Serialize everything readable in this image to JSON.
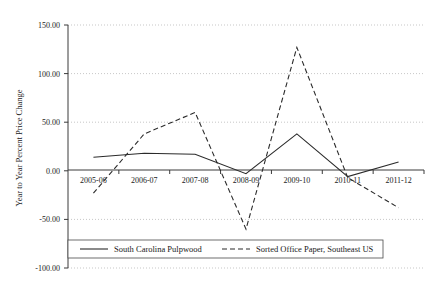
{
  "chart_data": {
    "type": "line",
    "title": "",
    "xlabel": "",
    "ylabel": "Year to Year Percent Price Change",
    "categories": [
      "2005-06",
      "2006-07",
      "2007-08",
      "2008-09",
      "2009-10",
      "2010-11",
      "2011-12"
    ],
    "ylim": [
      -100.0,
      150.0
    ],
    "ytick_labels": [
      "150.00",
      "100.00",
      "50.00",
      "0.00",
      "-50.00",
      "-100.00"
    ],
    "ytick_values": [
      150,
      100,
      50,
      0,
      -50,
      -100
    ],
    "grid": true,
    "legend_position": "bottom",
    "series": [
      {
        "name": "South Carolina Pulpwood",
        "style": "solid",
        "color": "#2b2b2b",
        "values": [
          14,
          18,
          17,
          -3,
          38,
          -6,
          9
        ]
      },
      {
        "name": "Sorted Office Paper, Southeast US",
        "style": "dashed",
        "color": "#2b2b2b",
        "values": [
          -23,
          38,
          60,
          -60,
          127,
          -7,
          -38
        ]
      }
    ]
  },
  "legend": {
    "entries": [
      {
        "label": "South Carolina Pulpwood",
        "style": "solid"
      },
      {
        "label": "Sorted Office Paper, Southeast US",
        "style": "dashed"
      }
    ]
  }
}
